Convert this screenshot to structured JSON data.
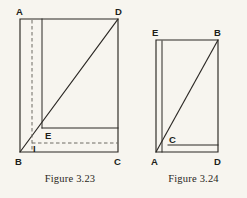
{
  "page": {
    "background_color": "#f7f5ef",
    "ink_color": "#2b2824",
    "dash_color": "#6d6a62"
  },
  "figures": [
    {
      "id": "figure-3-23",
      "caption": "Figure 3.23",
      "vertex_labels": {
        "a": "A",
        "d": "D",
        "b": "B",
        "c": "C",
        "e": "E",
        "i": "I"
      },
      "description_elements": {
        "rectangle": "A-D-C-B",
        "diagonal": "B-D",
        "inner_vertical_solid": "top-to-E",
        "inner_vertical_dashed": "top-to-bottom",
        "horizontal_solid_at_E": "E-to-right-edge",
        "horizontal_dashed_at_I": "I-to-right-edge"
      }
    },
    {
      "id": "figure-3-24",
      "caption": "Figure 3.24",
      "vertex_labels": {
        "e": "E",
        "b": "B",
        "a": "A",
        "d": "D",
        "c": "C"
      },
      "description_elements": {
        "rectangle": "E-B-D-A",
        "diagonal": "A-B",
        "inner_vertical_solid": "second-left-vertical",
        "horizontal_solid_at_C": "C-to-right-edge"
      }
    }
  ]
}
